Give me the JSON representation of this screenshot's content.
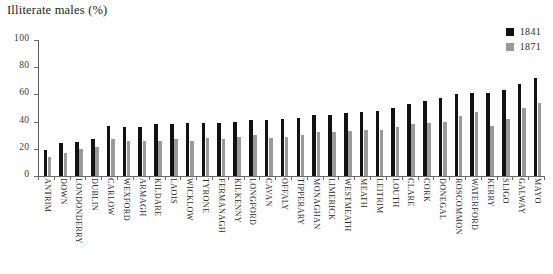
{
  "chart_data": {
    "type": "bar",
    "title": "Illiterate males (%)",
    "subtitle": "",
    "xlabel": "",
    "ylabel": "",
    "ylim": [
      0,
      100
    ],
    "yticks": [
      0,
      20,
      40,
      60,
      80,
      100
    ],
    "ytick_labels": [
      "0",
      "20",
      "40",
      "60",
      "80",
      "100"
    ],
    "grid": false,
    "legend_position": "top-right",
    "orientation": "vertical",
    "categories": [
      "ANTRIM",
      "DOWN",
      "LONDONDERRY",
      "DUBLIN",
      "CARLOW",
      "WEXFORD",
      "ARMAGH",
      "KILDARE",
      "LAOIS",
      "WICKLOW",
      "TYRONE",
      "FERMANAGH",
      "KILKENNY",
      "LONGFORD",
      "CAVAN",
      "OFFALY",
      "TIPPERARY",
      "MONAGHAN",
      "LIMERICK",
      "WESTMEATH",
      "MEATH",
      "LEITRIM",
      "LOUTH",
      "CLARE",
      "CORK",
      "DONEGAL",
      "ROSCOMMON",
      "WATERFORD",
      "KERRY",
      "SLIGO",
      "GALWAY",
      "MAYO"
    ],
    "series": [
      {
        "name": "1841",
        "color": "#121212",
        "values": [
          19,
          24,
          25,
          27,
          37,
          36,
          36,
          38,
          38,
          39,
          39,
          39,
          40,
          41,
          41,
          42,
          43,
          45,
          45,
          46,
          47,
          48,
          50,
          53,
          55,
          57,
          60,
          61,
          61,
          63,
          68,
          72
        ]
      },
      {
        "name": "1871",
        "color": "#9a9a9a",
        "values": [
          14,
          17,
          20,
          21,
          27,
          26,
          26,
          26,
          27,
          26,
          28,
          27,
          29,
          30,
          28,
          29,
          30,
          32,
          32,
          33,
          34,
          34,
          36,
          38,
          39,
          40,
          44,
          47,
          37,
          42,
          50,
          54
        ]
      }
    ]
  },
  "legend": {
    "entries": [
      {
        "label": "1841",
        "color": "#121212"
      },
      {
        "label": "1871",
        "color": "#9a9a9a"
      }
    ]
  }
}
